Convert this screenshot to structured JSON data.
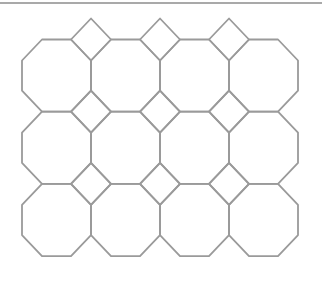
{
  "diagram": {
    "width": 323,
    "height": 292,
    "stroke_color": "#9a9a9a",
    "rule_color": "#8c8c8c",
    "stroke_width": 1.8,
    "top_rule": {
      "x1": 0,
      "x2": 322,
      "y": 3
    },
    "grid": {
      "origin_x": 22,
      "origin_y": 39.5,
      "cell_width": 69,
      "cell_height": 72.2,
      "cols": 4,
      "rows": 3,
      "cut_x": 20,
      "cut_y": 21
    },
    "shapes": {
      "octagon_count": 12,
      "square_count": 9
    }
  }
}
